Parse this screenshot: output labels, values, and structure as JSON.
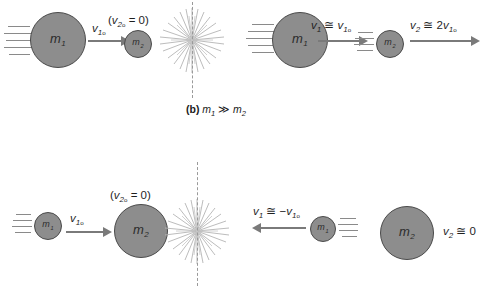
{
  "figure": {
    "background_color": "#ffffff",
    "ball_fill": "#8d8d8d",
    "ball_stroke": "#4a4a4a",
    "arrow_color": "#7a7a7a",
    "speedline_color": "#8a8a8a",
    "dash_color": "#9a9a9a",
    "text_color": "#1f1f1f"
  },
  "panel_b": {
    "caption_marker": "(b)",
    "caption_relation": "m₁ ≫ m₂",
    "caption_m1": "m",
    "caption_m1_sub": "1",
    "caption_op": "≫",
    "caption_m2": "m",
    "caption_m2_sub": "2",
    "before": {
      "ball_large": {
        "label": "m",
        "sub": "1"
      },
      "ball_small": {
        "label": "m",
        "sub": "2"
      },
      "arrow_label": "v1o",
      "arrow_v": "v",
      "arrow_sub": "1",
      "arrow_subo": "o",
      "rest_label": "(v2o = 0)",
      "rest_open": "(",
      "rest_v": "v",
      "rest_sub": "2",
      "rest_subo": "o",
      "rest_eq": " = 0)"
    },
    "after": {
      "ball_large": {
        "label": "m",
        "sub": "1"
      },
      "ball_small": {
        "label": "m",
        "sub": "2"
      },
      "label_left": "v1 ≅ v1o",
      "left_v": "v",
      "left_sub": "1",
      "left_op": " ≅ ",
      "left_v2": "v",
      "left_sub2": "1",
      "left_subo": "o",
      "label_right": "v2 ≅ 2v1o",
      "right_v": "v",
      "right_sub": "2",
      "right_op": " ≅ 2",
      "right_v2": "v",
      "right_sub2": "1",
      "right_subo": "o"
    }
  },
  "panel_c": {
    "caption_relation": "",
    "before": {
      "ball_small": {
        "label": "m",
        "sub": "1"
      },
      "ball_large": {
        "label": "m",
        "sub": "2"
      },
      "arrow_label": "v1o",
      "arrow_v": "v",
      "arrow_sub": "1",
      "arrow_subo": "o",
      "rest_label": "(v2o = 0)",
      "rest_open": "(",
      "rest_v": "v",
      "rest_sub": "2",
      "rest_subo": "o",
      "rest_eq": " = 0)"
    },
    "after": {
      "ball_small": {
        "label": "m",
        "sub": "1"
      },
      "ball_large": {
        "label": "m",
        "sub": "2"
      },
      "label_left": "v1 ≅ −v1o",
      "left_v": "v",
      "left_sub": "1",
      "left_op": " ≅ −",
      "left_v2": "v",
      "left_sub2": "1",
      "left_subo": "o",
      "label_right": "v2 ≅ 0",
      "right_v": "v",
      "right_sub": "2",
      "right_op": " ≅ 0"
    }
  }
}
